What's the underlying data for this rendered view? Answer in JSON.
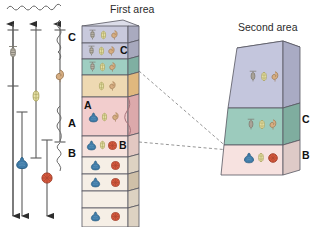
{
  "figure": {
    "type": "biostratigraphic-correlation-diagram",
    "titles": {
      "first_area": "First area",
      "second_area": "Second area"
    }
  },
  "range_chart": {
    "description": "Five vertical fossil range bars with double-headed arrows indicating unknown extent beyond the section",
    "bars": [
      {
        "id": "bar-1",
        "fossil": "trilobite-icon",
        "fossil_color": "#b8b0a4",
        "x": 13,
        "top": 22,
        "bottom": 215,
        "cap_top": 28,
        "cap_bottom": 86,
        "icon_y": 52,
        "arrow_top": true,
        "arrow_bottom": true
      },
      {
        "id": "bar-2",
        "fossil": "ammonite-yellow-icon",
        "fossil_color": "#e2dca0",
        "x": 36,
        "top": 22,
        "bottom": 160,
        "cap_top": 28,
        "cap_bottom": 158,
        "icon_y": 96,
        "arrow_top": true,
        "arrow_bottom": false
      },
      {
        "id": "bar-3",
        "fossil": "gastropod-tan-icon",
        "fossil_color": "#d8b58a",
        "x": 60,
        "top": 22,
        "bottom": 143,
        "cap_top": 28,
        "cap_bottom": 142,
        "icon_y": 76,
        "arrow_top": true,
        "arrow_bottom": false
      },
      {
        "id": "bar-4",
        "fossil": "bivalve-blue-icon",
        "fossil_color": "#3f7ba8",
        "x": 22,
        "top": 112,
        "bottom": 215,
        "cap_top": 114,
        "cap_bottom": 215,
        "icon_y": 163,
        "arrow_top": false,
        "arrow_bottom": true
      },
      {
        "id": "bar-5",
        "fossil": "brachiopod-red-icon",
        "fossil_color": "#d4583d",
        "x": 47,
        "top": 140,
        "bottom": 215,
        "cap_top": 142,
        "cap_bottom": 215,
        "icon_y": 178,
        "arrow_top": false,
        "arrow_bottom": true
      }
    ],
    "top_brace": {
      "id": "top-brace",
      "x1": 8,
      "x2": 64,
      "y": 7
    },
    "zone_braces": [
      {
        "label": "C",
        "label_x": 69,
        "label_y": 37,
        "brace_top": 20,
        "brace_bottom": 60,
        "brace_x": 58
      },
      {
        "label": "A",
        "label_x": 69,
        "label_y": 124,
        "brace_top": 106,
        "brace_bottom": 141,
        "brace_x": 58
      },
      {
        "label": "B",
        "label_x": 69,
        "label_y": 152,
        "brace_top": 142,
        "brace_bottom": 171,
        "brace_x": 58
      }
    ]
  },
  "first_area": {
    "title": "First area",
    "title_x": 112,
    "title_y": 6,
    "column_label_letters": [
      {
        "text": "C",
        "x": 124,
        "y": 40
      },
      {
        "text": "A",
        "x": 85,
        "y": 118
      },
      {
        "text": "B",
        "x": 124,
        "y": 150
      }
    ],
    "layers": [
      {
        "id": "layer-1",
        "top": 20,
        "height": 21,
        "fill": "#c8c9dc",
        "side": "#a9aabf",
        "fossils": [
          "trilobite-icon",
          "ammonite-yellow-icon",
          "gastropod-tan-icon"
        ]
      },
      {
        "id": "layer-2",
        "top": 41,
        "height": 17,
        "fill": "#c6c7da",
        "side": "#a7a8bd",
        "fossils": [
          "trilobite-icon",
          "ammonite-yellow-icon",
          "gastropod-tan-icon"
        ]
      },
      {
        "id": "layer-3",
        "top": 58,
        "height": 17,
        "fill": "#9fcec2",
        "side": "#7fae a2",
        "fossils": [
          "trilobite-icon",
          "ammonite-yellow-icon",
          "gastropod-tan-icon"
        ]
      },
      {
        "id": "layer-4",
        "top": 75,
        "height": 23,
        "fill": "#eed9b2",
        "side": "#d6bc91",
        "fossils": [
          "ammonite-yellow-icon",
          "gastropod-tan-icon"
        ]
      },
      {
        "id": "layer-5",
        "top": 98,
        "height": 38,
        "fill": "#f2cdcd",
        "side": "#d9aaab",
        "fossils": [
          "bivalve-blue-icon",
          "ammonite-yellow-icon",
          "gastropod-tan-icon"
        ]
      },
      {
        "id": "layer-6",
        "top": 136,
        "height": 22,
        "fill": "#f7e3de",
        "side": "#ddc3bd",
        "fossils": [
          "bivalve-blue-icon",
          "ammonite-yellow-icon",
          "brachiopod-red-icon"
        ]
      },
      {
        "id": "layer-7",
        "top": 158,
        "height": 17,
        "fill": "#f6efe6",
        "side": "#dcd3c6",
        "fossils": [
          "bivalve-blue-icon",
          "brachiopod-red-icon"
        ]
      },
      {
        "id": "layer-8",
        "top": 175,
        "height": 17,
        "fill": "#f6efe6",
        "side": "#dcd3c6",
        "fossils": [
          "bivalve-blue-icon",
          "brachiopod-red-icon"
        ]
      },
      {
        "id": "layer-9",
        "top": 192,
        "height": 17,
        "fill": "#f6efe6",
        "side": "#dcd3c6",
        "fossils": []
      },
      {
        "id": "layer-10",
        "top": 209,
        "height": 18,
        "fill": "#f6efe6",
        "side": "#dcd3c6",
        "fossils": [
          "bivalve-blue-icon",
          "brachiopod-red-icon"
        ]
      }
    ]
  },
  "second_area": {
    "title": "Second area",
    "title_x": 243,
    "title_y": 25,
    "layers": [
      {
        "id": "sa-layer-top",
        "label": "",
        "fill": "#c4c6dd",
        "side": "#a6a8c2",
        "fossils": [
          "trilobite-icon",
          "ammonite-yellow-icon",
          "gastropod-tan-icon"
        ]
      },
      {
        "id": "sa-layer-c",
        "label": "C",
        "fill": "#9ccbbd",
        "side": "#7dab9e",
        "fossils": [
          "trilobite-icon",
          "ammonite-yellow-icon",
          "gastropod-tan-icon"
        ]
      },
      {
        "id": "sa-layer-b",
        "label": "B",
        "fill": "#f7e2e0",
        "side": "#ddc5c2",
        "fossils": [
          "bivalve-blue-icon",
          "ammonite-yellow-icon",
          "brachiopod-red-icon"
        ]
      }
    ],
    "side_labels": [
      {
        "text": "C",
        "x": 302,
        "y": 117
      },
      {
        "text": "B",
        "x": 302,
        "y": 153
      }
    ]
  },
  "correlation_lines": [
    {
      "id": "corr-line-upper",
      "from_x": 140,
      "from_y": 72,
      "to_x": 228,
      "to_y": 148
    },
    {
      "id": "corr-line-lower",
      "from_x": 140,
      "from_y": 143,
      "to_x": 228,
      "to_y": 150
    }
  ],
  "colors": {
    "fossil_trilobite": "#b9b2a6",
    "fossil_ammonite_yellow": "#e4dea4",
    "fossil_gastropod_tan": "#cfa97e",
    "fossil_bivalve_blue": "#3f7ba8",
    "fossil_brachiopod_red": "#d4583d",
    "outline": "#4a4a4a",
    "dash": "#8a8a8a"
  }
}
